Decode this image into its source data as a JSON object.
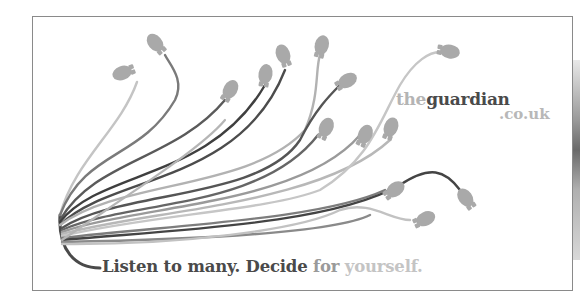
{
  "ad": {
    "brand": {
      "prefix": "the",
      "name": "guardian",
      "domain": ".co.uk"
    },
    "slogan": {
      "part1": "Listen to many. Decide ",
      "part2": "for ",
      "part3": "yourself."
    },
    "illustration": {
      "description": "bundle of computer-mouse cables fanning out from a single cord",
      "mouse_count": 16,
      "mouse_icon": "computer-mouse-icon"
    },
    "colors": {
      "dark_text": "#4a4a4a",
      "mid_text": "#9a9a9a",
      "light_text": "#c4c4c4",
      "mouse_fill": "#a8a8a8",
      "frame_border": "#8a8a8a"
    }
  }
}
